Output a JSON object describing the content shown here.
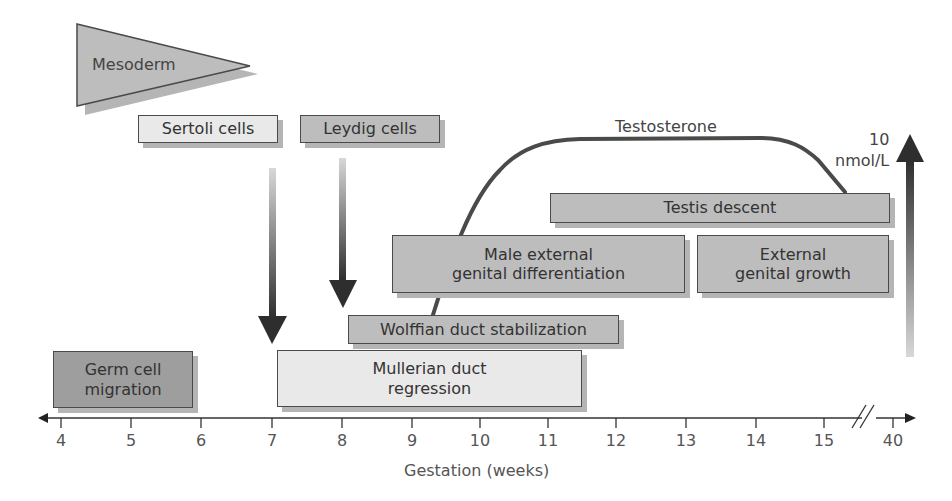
{
  "diagram": {
    "x_axis": {
      "label": "Gestation (weeks)",
      "ticks": [
        "4",
        "5",
        "6",
        "7",
        "8",
        "9",
        "10",
        "11",
        "12",
        "13",
        "14",
        "15",
        "40"
      ],
      "break_between": [
        "15",
        "40"
      ]
    },
    "mesoderm": {
      "label": "Mesoderm"
    },
    "sertoli": {
      "label": "Sertoli cells"
    },
    "leydig": {
      "label": "Leydig cells"
    },
    "testosterone": {
      "label": "Testosterone",
      "scale_value": "10",
      "scale_unit": "nmol/L"
    },
    "boxes": {
      "testis_descent": {
        "label": "Testis descent"
      },
      "male_external": {
        "line1": "Male external",
        "line2": "genital differentiation"
      },
      "external_growth": {
        "line1": "External",
        "line2": "genital growth"
      },
      "wolffian": {
        "label": "Wolffian duct stabilization"
      },
      "germ_cell": {
        "line1": "Germ cell",
        "line2": "migration"
      },
      "mullerian": {
        "line1": "Mullerian duct",
        "line2": "regression"
      }
    },
    "colors": {
      "dark": "#9e9e9e",
      "mid": "#bdbdbd",
      "light": "#e9e9e9",
      "line": "#4a4a4a"
    }
  }
}
